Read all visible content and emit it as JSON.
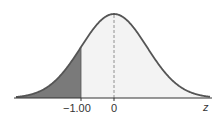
{
  "diagram": {
    "type": "normal-distribution",
    "axis_label": "z",
    "ticks": [
      {
        "value": -1.0,
        "label": "−1.00"
      },
      {
        "value": 0,
        "label": "0"
      }
    ],
    "shaded_region": {
      "from": "-inf",
      "to": -1.0,
      "color": "#7a7a7a"
    },
    "unshaded_fill": "#f3f3f3",
    "curve_color": "#555555",
    "mean_line": "dashed"
  }
}
